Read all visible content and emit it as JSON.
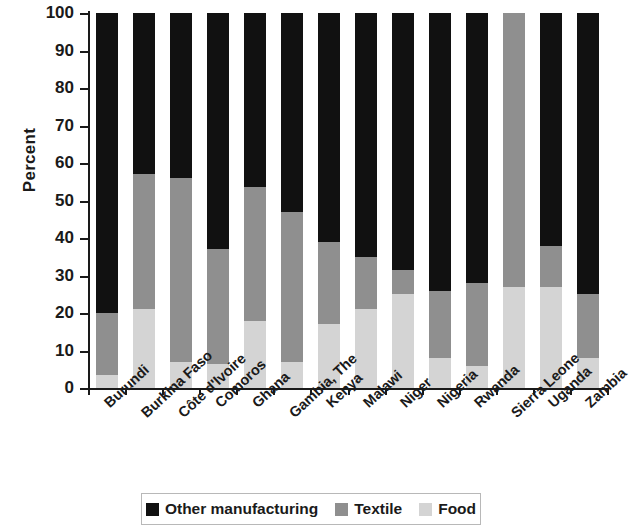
{
  "chart_data": {
    "type": "bar",
    "subtype": "stacked-bar-100",
    "title": "",
    "xlabel": "",
    "ylabel": "Percent",
    "ylim": [
      0,
      100
    ],
    "yticks": [
      0,
      10,
      20,
      30,
      40,
      50,
      60,
      70,
      80,
      90,
      100
    ],
    "grid": false,
    "legend_position": "bottom",
    "categories": [
      "Burundi",
      "Burkina Faso",
      "Côte d'Ivoire",
      "Comoros",
      "Ghana",
      "Gambia, The",
      "Kenya",
      "Malawi",
      "Niger",
      "Nigeria",
      "Rwanda",
      "Sierra Leone",
      "Uganda",
      "Zambia"
    ],
    "series": [
      {
        "name": "Food",
        "color": "#d4d4d4",
        "values": [
          3.5,
          21,
          7,
          6.5,
          18,
          7,
          17,
          21,
          25,
          8,
          6,
          27,
          27,
          8
        ]
      },
      {
        "name": "Textile",
        "color": "#8f8f8f",
        "values": [
          16.5,
          36,
          49,
          30.5,
          35.5,
          40,
          22,
          14,
          6.5,
          18,
          22,
          73,
          11,
          17
        ]
      },
      {
        "name": "Other manufacturing",
        "color": "#111111",
        "values": [
          80,
          43,
          44,
          63,
          46.5,
          53,
          61,
          65,
          68.5,
          74,
          72,
          0,
          62,
          75
        ]
      }
    ],
    "stack_order_bottom_to_top": [
      "Food",
      "Textile",
      "Other manufacturing"
    ],
    "cumulative_tops": {
      "food": [
        3.5,
        21,
        7,
        6.5,
        18,
        7,
        17,
        21,
        25,
        8,
        6,
        27,
        27,
        8
      ],
      "food_plus_textile": [
        20,
        57,
        56,
        37,
        53.5,
        47,
        39,
        35,
        31.5,
        26,
        28,
        100,
        38,
        25
      ],
      "total": [
        100,
        100,
        100,
        100,
        100,
        100,
        100,
        100,
        100,
        100,
        100,
        100,
        100,
        100
      ]
    }
  },
  "axis": {
    "y_title": "Percent",
    "y_tick_labels": [
      "0",
      "10",
      "20",
      "30",
      "40",
      "50",
      "60",
      "70",
      "80",
      "90",
      "100"
    ]
  },
  "legend": {
    "items": [
      {
        "label": "Other manufacturing",
        "color": "#111111"
      },
      {
        "label": "Textile",
        "color": "#8f8f8f"
      },
      {
        "label": "Food",
        "color": "#d4d4d4"
      }
    ]
  }
}
